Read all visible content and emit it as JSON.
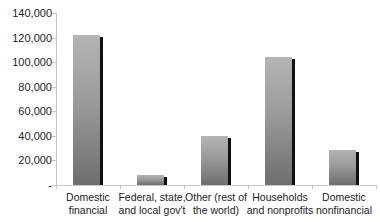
{
  "chart_data": {
    "type": "bar",
    "title": "",
    "xlabel": "",
    "ylabel": "",
    "categories": [
      "Domestic financial",
      "Federal, state, and local gov't",
      "Other (rest of the world)",
      "Households and nonprofits",
      "Domestic nonfinancial"
    ],
    "category_lines": [
      [
        "Domestic",
        "financial"
      ],
      [
        "Federal, state,",
        "and local gov't"
      ],
      [
        "Other (rest of",
        "the world)"
      ],
      [
        "Households",
        "and nonprofits"
      ],
      [
        "Domestic",
        "nonfinancial"
      ]
    ],
    "values": [
      122000,
      8000,
      40000,
      104000,
      28500
    ],
    "ylim": [
      0,
      140000
    ],
    "yticks": [
      0,
      20000,
      40000,
      60000,
      80000,
      100000,
      120000,
      140000
    ],
    "ytick_labels": [
      "-",
      "20,000",
      "40,000",
      "60,000",
      "80,000",
      "100,000",
      "120,000",
      "140,000"
    ],
    "grid": false,
    "legend": null,
    "colors": {
      "bar_top": "#b4b4b4",
      "bar_bottom": "#6e6e6e",
      "bar_shadow": "#111111",
      "axis": "#c8c8c8"
    }
  }
}
